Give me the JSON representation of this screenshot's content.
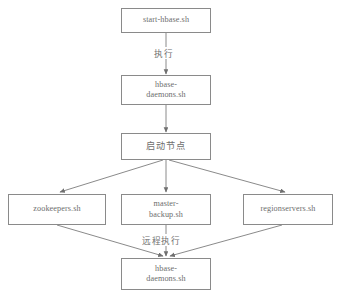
{
  "diagram": {
    "canvas": {
      "width": 341,
      "height": 295,
      "background": "#ffffff"
    },
    "style": {
      "box_border": "#8a8a8a",
      "text_color": "#6e6e6e",
      "edge_color": "#7d7d7d"
    },
    "nodes": [
      {
        "id": "start-hbase",
        "label": "start-hbase.sh",
        "script": "Latin",
        "x": 121,
        "y": 8,
        "w": 90,
        "h": 25
      },
      {
        "id": "hbase-daemons-top",
        "label": "hbase-\ndaemons.sh",
        "script": "Latin",
        "x": 121,
        "y": 75,
        "w": 90,
        "h": 30
      },
      {
        "id": "start-node",
        "label": "启动节点",
        "script": "CJK",
        "x": 121,
        "y": 133,
        "w": 90,
        "h": 27
      },
      {
        "id": "zookeepers",
        "label": "zookeepers.sh",
        "script": "Latin",
        "x": 8,
        "y": 194,
        "w": 98,
        "h": 31
      },
      {
        "id": "master-backup",
        "label": "master-\nbackup.sh",
        "script": "Latin",
        "x": 121,
        "y": 194,
        "w": 90,
        "h": 31
      },
      {
        "id": "regionservers",
        "label": "regionservers.sh",
        "script": "Latin",
        "x": 243,
        "y": 194,
        "w": 90,
        "h": 31
      },
      {
        "id": "hbase-daemons-bottom",
        "label": "hbase-\ndaemons.sh",
        "script": "Latin",
        "x": 121,
        "y": 258,
        "w": 90,
        "h": 32
      }
    ],
    "edge_labels": [
      {
        "id": "execute",
        "label": "执行",
        "x": 152,
        "y": 47
      },
      {
        "id": "remote-execute",
        "label": "远程执行",
        "x": 140,
        "y": 234
      }
    ],
    "edges": [
      {
        "from": "start-hbase",
        "to": "hbase-daemons-top",
        "label": "执行"
      },
      {
        "from": "hbase-daemons-top",
        "to": "start-node",
        "label": ""
      },
      {
        "from": "start-node",
        "to": "zookeepers",
        "label": ""
      },
      {
        "from": "start-node",
        "to": "master-backup",
        "label": ""
      },
      {
        "from": "start-node",
        "to": "regionservers",
        "label": ""
      },
      {
        "from": "zookeepers",
        "to": "hbase-daemons-bottom",
        "label": "远程执行"
      },
      {
        "from": "master-backup",
        "to": "hbase-daemons-bottom",
        "label": "远程执行"
      },
      {
        "from": "regionservers",
        "to": "hbase-daemons-bottom",
        "label": "远程执行"
      }
    ]
  }
}
